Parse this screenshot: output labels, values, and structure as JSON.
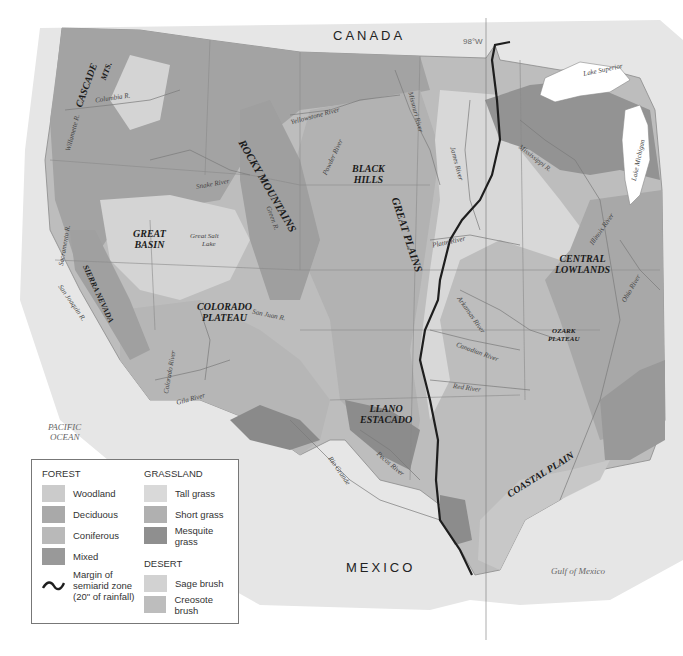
{
  "map": {
    "title": "Vegetation regions of the western and central United States",
    "countries": {
      "north": "CANADA",
      "south": "MEXICO"
    },
    "meridian_label": "98°W",
    "oceans": [
      {
        "id": "pacific",
        "line1": "PACIFIC",
        "line2": "OCEAN"
      },
      {
        "id": "gulf",
        "line1": "Gulf of Mexico"
      }
    ],
    "physiographic_regions": [
      {
        "id": "cascade",
        "text": "CASCADE"
      },
      {
        "id": "mts",
        "text": "MTS."
      },
      {
        "id": "rocky",
        "text": "ROCKY MOUNTAINS"
      },
      {
        "id": "black_hills",
        "line1": "BLACK",
        "line2": "HILLS"
      },
      {
        "id": "great_plains",
        "text": "GREAT PLAINS"
      },
      {
        "id": "great_basin",
        "line1": "GREAT",
        "line2": "BASIN"
      },
      {
        "id": "sierra_nevada",
        "text": "SIERRA NEVADA"
      },
      {
        "id": "colorado_plateau",
        "line1": "COLORADO",
        "line2": "PLATEAU"
      },
      {
        "id": "central_lowlands",
        "line1": "CENTRAL",
        "line2": "LOWLANDS"
      },
      {
        "id": "ozark_plateau",
        "line1": "OZARK",
        "line2": "PLATEAU"
      },
      {
        "id": "llano_estacado",
        "line1": "LLANO",
        "line2": "ESTACADO"
      },
      {
        "id": "coastal_plain",
        "text": "COASTAL PLAIN"
      }
    ],
    "water_features": [
      {
        "id": "columbia",
        "text": "Columbia R."
      },
      {
        "id": "willamette",
        "text": "Willamette R."
      },
      {
        "id": "snake",
        "text": "Snake River"
      },
      {
        "id": "yellowstone",
        "text": "Yellowstone River"
      },
      {
        "id": "powder",
        "text": "Powder River"
      },
      {
        "id": "missouri",
        "text": "Missouri River"
      },
      {
        "id": "james",
        "text": "James River"
      },
      {
        "id": "mississippi",
        "text": "Mississippi R."
      },
      {
        "id": "lake_superior",
        "text": "Lake Superior"
      },
      {
        "id": "lake_michigan",
        "text": "Lake Michigan"
      },
      {
        "id": "illinois",
        "text": "Illinois River"
      },
      {
        "id": "platte",
        "text": "Platte River"
      },
      {
        "id": "green",
        "text": "Green R."
      },
      {
        "id": "great_salt_lake_1",
        "text": "Great Salt"
      },
      {
        "id": "great_salt_lake_2",
        "text": "Lake"
      },
      {
        "id": "sacramento",
        "text": "Sacramento R."
      },
      {
        "id": "san_joaquin",
        "text": "San Joaquin R."
      },
      {
        "id": "san_juan",
        "text": "San Juan R."
      },
      {
        "id": "colorado",
        "text": "Colorado River"
      },
      {
        "id": "gila",
        "text": "Gila River"
      },
      {
        "id": "arkansas",
        "text": "Arkansas River"
      },
      {
        "id": "canadian",
        "text": "Canadian River"
      },
      {
        "id": "red",
        "text": "Red River"
      },
      {
        "id": "ohio",
        "text": "Ohio River"
      },
      {
        "id": "pecos",
        "text": "Pecos River"
      },
      {
        "id": "rio_grande",
        "text": "Rio Grande"
      }
    ]
  },
  "legend": {
    "forest": {
      "heading": "FOREST",
      "items": [
        {
          "label": "Woodland",
          "color": "#cbcbcb"
        },
        {
          "label": "Deciduous",
          "color": "#a9a9a9"
        },
        {
          "label": "Coniferous",
          "color": "#b9b9b9"
        },
        {
          "label": "Mixed",
          "color": "#999999"
        }
      ]
    },
    "semiarid": {
      "line1": "Margin of",
      "line2": "semiarid zone",
      "line3": "(20\" of rainfall)"
    },
    "grassland": {
      "heading": "GRASSLAND",
      "items": [
        {
          "label": "Tall grass",
          "color": "#d9d9d9"
        },
        {
          "label": "Short grass",
          "color": "#b0b0b0"
        },
        {
          "label": "Mesquite grass",
          "color": "#8f8f8f"
        }
      ]
    },
    "desert": {
      "heading": "DESERT",
      "items": [
        {
          "label": "Sage brush",
          "color": "#d2d2d2"
        },
        {
          "label": "Creosote brush",
          "color": "#bdbdbd"
        }
      ]
    }
  },
  "colors": {
    "land_base": "#bdbdbd",
    "outside_land": "#e4e4e4",
    "water": "#ffffff",
    "semiarid_line": "#1e1e1e",
    "border_line": "#8a8a8a"
  }
}
